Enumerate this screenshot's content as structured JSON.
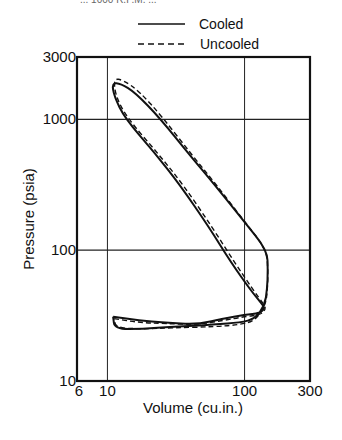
{
  "header": {
    "cut_text": "... 1000 R.P.M. ..."
  },
  "chart_data": {
    "type": "line",
    "title": "",
    "xlabel": "Volume (cu.in.)",
    "ylabel": "Pressure (psia)",
    "xscale": "log",
    "yscale": "log",
    "xlim": [
      6,
      300
    ],
    "ylim": [
      10,
      3000
    ],
    "x_ticks": [
      6,
      10,
      100,
      300
    ],
    "x_tick_labels": [
      "6",
      "10",
      "100",
      "300"
    ],
    "y_ticks": [
      10,
      100,
      1000,
      3000
    ],
    "y_tick_labels": [
      "10",
      "100",
      "1000",
      "3000"
    ],
    "grid": {
      "x": [
        10,
        100
      ],
      "y": [
        100,
        1000
      ]
    },
    "legend": {
      "position": "top-center",
      "entries": [
        {
          "label": "Cooled",
          "style": "solid"
        },
        {
          "label": "Uncooled",
          "style": "dashed"
        }
      ]
    },
    "series": [
      {
        "name": "Cooled",
        "style": "solid",
        "points": [
          [
            11.0,
            31
          ],
          [
            17,
            29
          ],
          [
            26,
            28
          ],
          [
            45,
            27
          ],
          [
            70,
            30
          ],
          [
            100,
            32
          ],
          [
            130,
            33
          ],
          [
            140,
            36
          ],
          [
            136,
            38
          ],
          [
            110,
            50
          ],
          [
            80,
            80
          ],
          [
            55,
            150
          ],
          [
            34,
            313
          ],
          [
            22,
            560
          ],
          [
            13.4,
            1020
          ],
          [
            11.2,
            1500
          ],
          [
            10.8,
            1900
          ],
          [
            12.5,
            1880
          ],
          [
            16,
            1600
          ],
          [
            24.2,
            1020
          ],
          [
            40,
            530
          ],
          [
            61,
            313
          ],
          [
            100,
            164
          ],
          [
            146,
            100
          ],
          [
            148,
            70
          ],
          [
            146,
            50
          ],
          [
            140,
            38
          ],
          [
            120,
            30
          ],
          [
            93,
            28
          ],
          [
            60,
            27
          ],
          [
            30,
            26
          ],
          [
            18,
            25
          ],
          [
            11.3,
            25
          ],
          [
            11.0,
            31
          ]
        ]
      },
      {
        "name": "Uncooled",
        "style": "dashed",
        "points": [
          [
            11.2,
            30
          ],
          [
            17,
            28
          ],
          [
            26,
            27.5
          ],
          [
            45,
            27
          ],
          [
            70,
            29
          ],
          [
            100,
            31
          ],
          [
            130,
            32
          ],
          [
            142,
            35
          ],
          [
            140,
            38
          ],
          [
            115,
            50
          ],
          [
            85,
            80
          ],
          [
            58,
            150
          ],
          [
            36,
            313
          ],
          [
            23,
            560
          ],
          [
            14,
            1020
          ],
          [
            11.5,
            1500
          ],
          [
            11.1,
            2050
          ],
          [
            13,
            2000
          ],
          [
            17,
            1650
          ],
          [
            25,
            1050
          ],
          [
            41,
            540
          ],
          [
            62,
            318
          ],
          [
            100,
            166
          ],
          [
            145,
            100
          ],
          [
            148,
            70
          ],
          [
            147,
            50
          ],
          [
            142,
            38
          ],
          [
            120,
            29
          ],
          [
            93,
            27
          ],
          [
            60,
            26
          ],
          [
            30,
            25.5
          ],
          [
            18,
            25
          ],
          [
            11.5,
            25.5
          ],
          [
            11.2,
            30
          ]
        ]
      }
    ]
  }
}
